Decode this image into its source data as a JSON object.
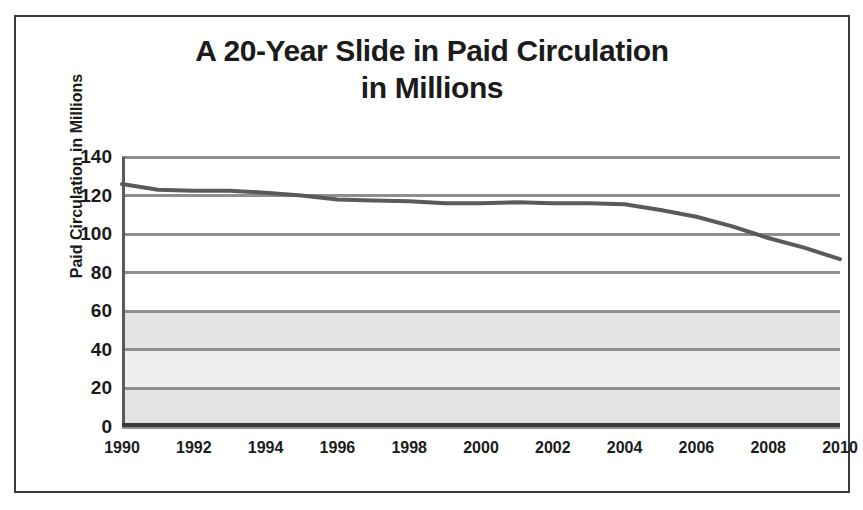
{
  "chart_data": {
    "type": "line",
    "title": "A 20-Year Slide in Paid Circulation in Millions",
    "title_lines": [
      "A 20-Year Slide in Paid Circulation",
      "in Millions"
    ],
    "xlabel": "",
    "ylabel": "Paid Circulation in Millions",
    "xlim": [
      1990,
      2010
    ],
    "ylim": [
      0,
      140
    ],
    "ytick_step": 20,
    "xtick_step": 2,
    "yticks": [
      140,
      120,
      100,
      80,
      60,
      40,
      20,
      0
    ],
    "xticks": [
      1990,
      1992,
      1994,
      1996,
      1998,
      2000,
      2002,
      2004,
      2006,
      2008,
      2010
    ],
    "grid": true,
    "legend": false,
    "x": [
      1990,
      1991,
      1992,
      1993,
      1994,
      1995,
      1996,
      1997,
      1998,
      1999,
      2000,
      2001,
      2002,
      2003,
      2004,
      2005,
      2006,
      2007,
      2008,
      2009,
      2010
    ],
    "values": [
      126,
      123,
      122.5,
      122.5,
      121.5,
      120,
      118,
      117.5,
      117,
      116,
      116,
      116.5,
      116,
      116,
      115.5,
      112.5,
      109,
      104,
      98,
      93,
      87
    ],
    "series": [
      {
        "name": "Paid Circulation",
        "color": "#5a5a5a",
        "values": [
          126,
          123,
          122.5,
          122.5,
          121.5,
          120,
          118,
          117.5,
          117,
          116,
          116,
          116.5,
          116,
          116,
          115.5,
          112.5,
          109,
          104,
          98,
          93,
          87
        ]
      }
    ],
    "colors": {
      "line": "#5a5a5a",
      "gridline": "#8f8f8f",
      "axis": "#3a3a3a",
      "frame": "#3a3a3a",
      "text": "#1b1b1b",
      "band_light": "#ffffff",
      "band_shade": "#e6e6e6"
    }
  }
}
